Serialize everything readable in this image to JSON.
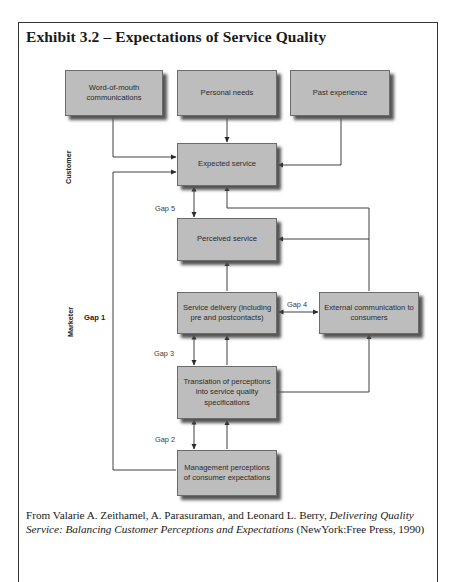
{
  "exhibit": {
    "title": "Exhibit 3.2 – Expectations of Service Quality"
  },
  "diagram": {
    "side_labels": {
      "customer": "Customer",
      "marketer": "Marketer"
    },
    "boxes": {
      "word_of_mouth": "Word-of-mouth communications",
      "personal_needs": "Personal needs",
      "past_experience": "Past experience",
      "expected_service": "Expected service",
      "perceived_service": "Perceived service",
      "service_delivery": "Service delivery (including pre and postcontacts)",
      "external_communication": "External communication to consumers",
      "translation": "Translation of perceptions into service quality specifications",
      "management_perceptions": "Management perceptions of consumer expectations"
    },
    "gaps": {
      "gap1": "Gap 1",
      "gap2": "Gap 2",
      "gap3": "Gap 3",
      "gap4": "Gap 4",
      "gap5": "Gap 5"
    },
    "line_color": "#2a2a2a",
    "box_fill": "#bdbdbd"
  },
  "caption": {
    "prefix": "From Valarie A. Zeithamel, A. Parasuraman, and Leonard L. Berry, ",
    "book_title": "Delivering Quality Service: Balancing Customer Perceptions and Expectations",
    "suffix": " (NewYork:Free Press, 1990)"
  }
}
